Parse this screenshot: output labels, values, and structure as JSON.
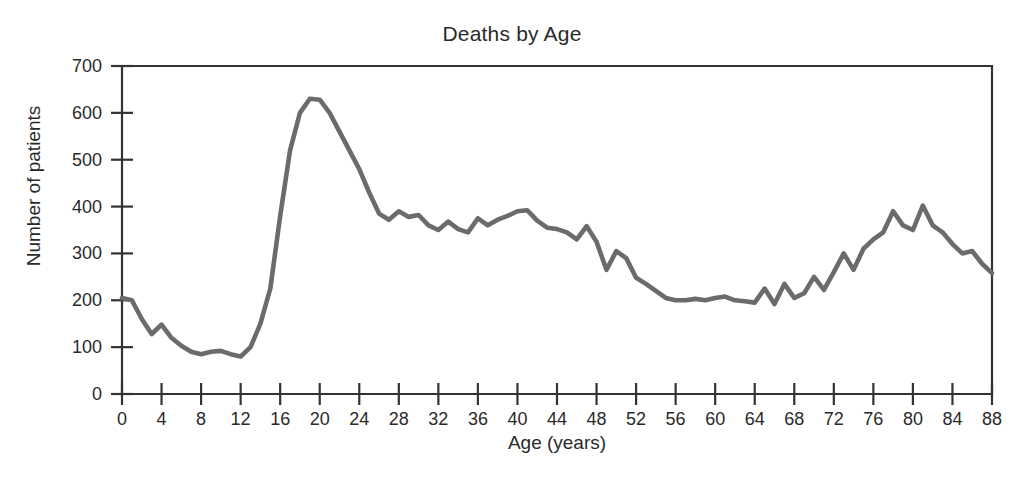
{
  "chart_data": {
    "type": "line",
    "title": "Deaths by Age",
    "xlabel": "Age (years)",
    "ylabel": "Number of patients",
    "grid": false,
    "legend": "none",
    "xlim": [
      0,
      88
    ],
    "ylim": [
      0,
      700
    ],
    "x_ticks": [
      0,
      4,
      8,
      12,
      16,
      20,
      24,
      28,
      32,
      36,
      40,
      44,
      48,
      52,
      56,
      60,
      64,
      68,
      72,
      76,
      80,
      84,
      88
    ],
    "y_ticks": [
      0,
      100,
      200,
      300,
      400,
      500,
      600,
      700
    ],
    "line_color": "#6b6b6b",
    "axis_color": "#333333",
    "background": "#ffffff",
    "series": [
      {
        "name": "Number of patients",
        "x": [
          0,
          1,
          2,
          3,
          4,
          5,
          6,
          7,
          8,
          9,
          10,
          11,
          12,
          13,
          14,
          15,
          16,
          17,
          18,
          19,
          20,
          21,
          22,
          23,
          24,
          25,
          26,
          27,
          28,
          29,
          30,
          31,
          32,
          33,
          34,
          35,
          36,
          37,
          38,
          39,
          40,
          41,
          42,
          43,
          44,
          45,
          46,
          47,
          48,
          49,
          50,
          51,
          52,
          53,
          54,
          55,
          56,
          57,
          58,
          59,
          60,
          61,
          62,
          63,
          64,
          65,
          66,
          67,
          68,
          69,
          70,
          71,
          72,
          73,
          74,
          75,
          76,
          77,
          78,
          79,
          80,
          81,
          82,
          83,
          84,
          85,
          86,
          87,
          88
        ],
        "values": [
          205,
          200,
          160,
          128,
          148,
          120,
          103,
          90,
          85,
          90,
          92,
          85,
          80,
          100,
          150,
          225,
          380,
          520,
          600,
          630,
          628,
          600,
          560,
          520,
          480,
          430,
          385,
          372,
          390,
          378,
          382,
          360,
          350,
          368,
          352,
          345,
          375,
          360,
          372,
          380,
          390,
          392,
          370,
          355,
          352,
          345,
          330,
          358,
          325,
          265,
          305,
          290,
          248,
          235,
          220,
          205,
          200,
          200,
          203,
          200,
          205,
          208,
          200,
          198,
          195,
          225,
          192,
          235,
          205,
          215,
          250,
          222,
          260,
          300,
          265,
          310,
          330,
          345,
          390,
          360,
          350,
          402,
          360,
          345,
          320,
          300,
          305,
          278,
          258
        ]
      }
    ]
  }
}
